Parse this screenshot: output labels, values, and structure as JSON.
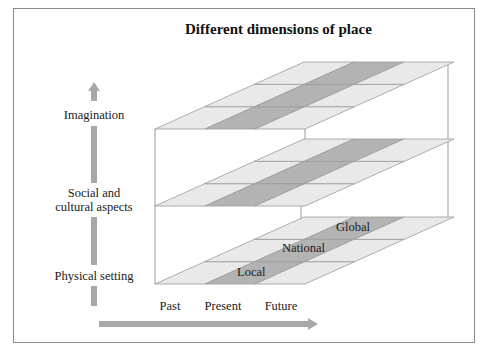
{
  "title": "Different dimensions of place",
  "vertical_axis": {
    "direction": "up",
    "levels": [
      {
        "label_lines": [
          "Imagination"
        ]
      },
      {
        "label_lines": [
          "Social and",
          "cultural aspects"
        ]
      },
      {
        "label_lines": [
          "Physical setting"
        ]
      }
    ]
  },
  "horizontal_axis": {
    "direction": "right",
    "labels": [
      "Past",
      "Present",
      "Future"
    ]
  },
  "depth_axis": {
    "labels": [
      "Local",
      "National",
      "Global"
    ]
  },
  "colors": {
    "cell_light": "#e9e9e9",
    "cell_dark": "#b3b3b3",
    "grid_line": "#9a9a9a",
    "arrow": "#a8a8a8",
    "frame": "#8c8c8c"
  }
}
